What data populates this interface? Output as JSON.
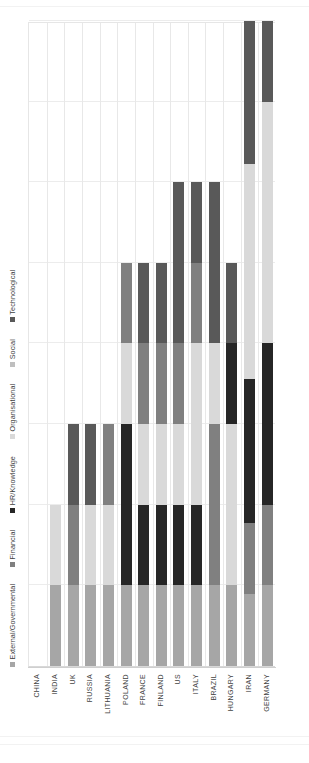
{
  "chart_data": {
    "type": "bar",
    "subtype": "stacked-horizontal",
    "title": "",
    "xlabel": "",
    "ylabel": "",
    "orientation": "horizontal-bars-rotated-90ccw",
    "grid": true,
    "legend_position": "top-left",
    "xlim": [
      0,
      8
    ],
    "axis_ticks": [
      0,
      1,
      2,
      3,
      4,
      5,
      6,
      7,
      8
    ],
    "categories": [
      "CHINA",
      "INDIA",
      "UK",
      "RUSSIA",
      "LITHUANIA",
      "POLAND",
      "FRANCE",
      "FINLAND",
      "US",
      "ITALY",
      "BRAZIL",
      "HUNGARY",
      "IRAN",
      "GERMANY"
    ],
    "series": [
      {
        "name": "External/Governmental",
        "color": "#a6a6a6",
        "values": [
          0,
          1,
          1,
          1,
          1,
          1,
          1,
          1,
          1,
          1,
          1,
          1,
          1,
          1
        ]
      },
      {
        "name": "Financial",
        "color": "#808080",
        "values": [
          0,
          0,
          1,
          0,
          1,
          1,
          1,
          1,
          1,
          1,
          2,
          0,
          1,
          1
        ]
      },
      {
        "name": "HR/Knowledge",
        "color": "#262626",
        "values": [
          0,
          0,
          0,
          0,
          0,
          2,
          1,
          1,
          1,
          1,
          0,
          1,
          2,
          2
        ]
      },
      {
        "name": "Organisational",
        "color": "#d9d9d9",
        "values": [
          0,
          1,
          0,
          1,
          1,
          1,
          1,
          1,
          1,
          1,
          1,
          2,
          3,
          3
        ]
      },
      {
        "name": "Social",
        "color": "#bfbfbf",
        "values": [
          0,
          0,
          0,
          0,
          0,
          0,
          0,
          0,
          0,
          0,
          0,
          0,
          0,
          0
        ]
      },
      {
        "name": "Technological",
        "color": "#595959",
        "values": [
          0,
          0,
          1,
          1,
          0,
          0,
          1,
          1,
          2,
          1,
          2,
          1,
          2,
          1
        ]
      }
    ],
    "totals": [
      0,
      2,
      3,
      3,
      3,
      5,
      5,
      5,
      6,
      6,
      6,
      5,
      9,
      8
    ],
    "bars": [
      {
        "category": "CHINA",
        "segments": []
      },
      {
        "category": "INDIA",
        "segments": [
          {
            "series": "External/Governmental",
            "value": 1
          },
          {
            "series": "Organisational",
            "value": 1
          }
        ]
      },
      {
        "category": "UK",
        "segments": [
          {
            "series": "External/Governmental",
            "value": 1
          },
          {
            "series": "Financial",
            "value": 1
          },
          {
            "series": "Technological",
            "value": 1
          }
        ]
      },
      {
        "category": "RUSSIA",
        "segments": [
          {
            "series": "External/Governmental",
            "value": 1
          },
          {
            "series": "Organisational",
            "value": 1
          },
          {
            "series": "Technological",
            "value": 1
          }
        ]
      },
      {
        "category": "LITHUANIA",
        "segments": [
          {
            "series": "External/Governmental",
            "value": 1
          },
          {
            "series": "Organisational",
            "value": 1
          },
          {
            "series": "Financial",
            "value": 1
          }
        ]
      },
      {
        "category": "POLAND",
        "segments": [
          {
            "series": "External/Governmental",
            "value": 1
          },
          {
            "series": "HR/Knowledge",
            "value": 2
          },
          {
            "series": "Organisational",
            "value": 1
          },
          {
            "series": "Financial",
            "value": 1
          }
        ]
      },
      {
        "category": "FRANCE",
        "segments": [
          {
            "series": "External/Governmental",
            "value": 1
          },
          {
            "series": "HR/Knowledge",
            "value": 1
          },
          {
            "series": "Organisational",
            "value": 1
          },
          {
            "series": "Financial",
            "value": 1
          },
          {
            "series": "Technological",
            "value": 1
          }
        ]
      },
      {
        "category": "FINLAND",
        "segments": [
          {
            "series": "External/Governmental",
            "value": 1
          },
          {
            "series": "HR/Knowledge",
            "value": 1
          },
          {
            "series": "Organisational",
            "value": 1
          },
          {
            "series": "Financial",
            "value": 1
          },
          {
            "series": "Technological",
            "value": 1
          }
        ]
      },
      {
        "category": "US",
        "segments": [
          {
            "series": "External/Governmental",
            "value": 1
          },
          {
            "series": "HR/Knowledge",
            "value": 1
          },
          {
            "series": "Organisational",
            "value": 1
          },
          {
            "series": "Financial",
            "value": 1
          },
          {
            "series": "Technological",
            "value": 2
          }
        ]
      },
      {
        "category": "ITALY",
        "segments": [
          {
            "series": "External/Governmental",
            "value": 1
          },
          {
            "series": "HR/Knowledge",
            "value": 1
          },
          {
            "series": "Organisational",
            "value": 2
          },
          {
            "series": "Financial",
            "value": 1
          },
          {
            "series": "Technological",
            "value": 1
          }
        ]
      },
      {
        "category": "BRAZIL",
        "segments": [
          {
            "series": "External/Governmental",
            "value": 1
          },
          {
            "series": "Financial",
            "value": 2
          },
          {
            "series": "Organisational",
            "value": 1
          },
          {
            "series": "Technological",
            "value": 2
          }
        ]
      },
      {
        "category": "HUNGARY",
        "segments": [
          {
            "series": "External/Governmental",
            "value": 1
          },
          {
            "series": "Organisational",
            "value": 2
          },
          {
            "series": "HR/Knowledge",
            "value": 1
          },
          {
            "series": "Technological",
            "value": 1
          }
        ]
      },
      {
        "category": "IRAN",
        "segments": [
          {
            "series": "External/Governmental",
            "value": 1
          },
          {
            "series": "Financial",
            "value": 1
          },
          {
            "series": "HR/Knowledge",
            "value": 2
          },
          {
            "series": "Organisational",
            "value": 3
          },
          {
            "series": "Technological",
            "value": 2
          }
        ]
      },
      {
        "category": "GERMANY",
        "segments": [
          {
            "series": "External/Governmental",
            "value": 1
          },
          {
            "series": "Financial",
            "value": 1
          },
          {
            "series": "HR/Knowledge",
            "value": 2
          },
          {
            "series": "Organisational",
            "value": 3
          },
          {
            "series": "Technological",
            "value": 1
          }
        ]
      }
    ]
  },
  "legend": {
    "items": [
      {
        "label": "External/Governmental",
        "color": "#a6a6a6"
      },
      {
        "label": "Financial",
        "color": "#808080"
      },
      {
        "label": "HR/Knowledge",
        "color": "#262626"
      },
      {
        "label": "Organisational",
        "color": "#d9d9d9"
      },
      {
        "label": "Social",
        "color": "#bfbfbf"
      },
      {
        "label": "Technological",
        "color": "#595959"
      }
    ]
  },
  "colors": {
    "external_governmental": "#a6a6a6",
    "financial": "#808080",
    "hr_knowledge": "#262626",
    "organisational": "#d9d9d9",
    "social": "#bfbfbf",
    "technological": "#595959",
    "gridline": "#ececec",
    "axis": "#cfcfcf",
    "text": "#434343",
    "background": "#ffffff"
  }
}
